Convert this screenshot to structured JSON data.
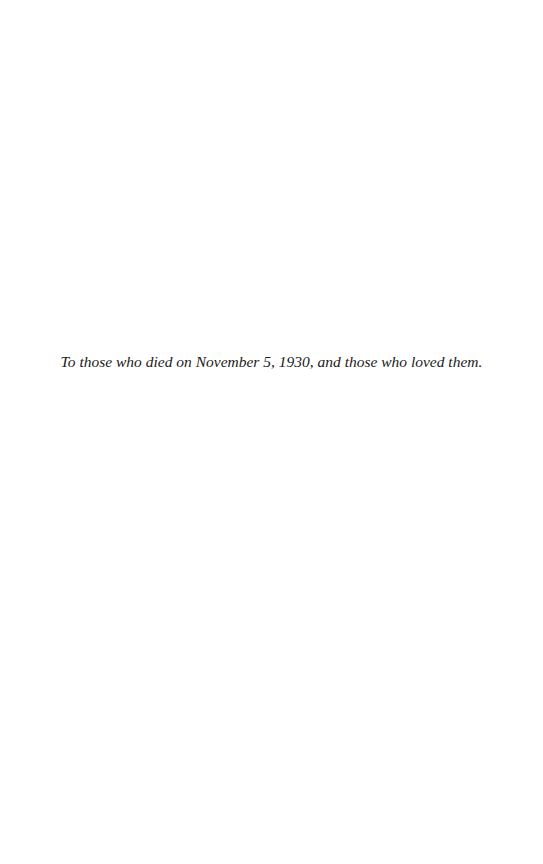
{
  "page": {
    "dedication": "To those who died on November 5, 1930, and those who loved them."
  }
}
